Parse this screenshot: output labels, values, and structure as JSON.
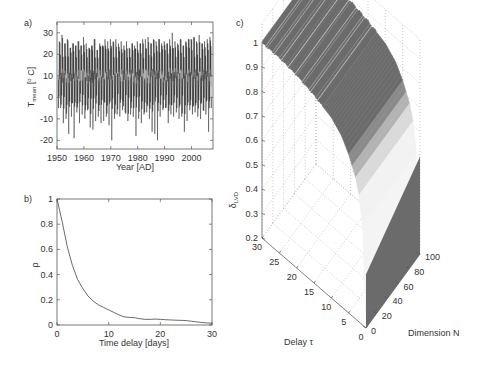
{
  "chart_data": [
    {
      "panel_label": "a)",
      "type": "line",
      "title": "",
      "xlabel": "Year [AD]",
      "ylabel": "T_mean [° C]",
      "ylabel_main": "T",
      "ylabel_sub": "mean",
      "ylabel_unit": "[",
      "ylabel_unit_sup": "o",
      "ylabel_unit_end": " C]",
      "xlim": [
        1950,
        2008
      ],
      "ylim": [
        -24,
        35
      ],
      "xticks": [
        1950,
        1960,
        1970,
        1980,
        1990,
        2000
      ],
      "yticks": [
        -20,
        -10,
        0,
        10,
        20,
        30
      ],
      "grid": false,
      "description": "Daily mean temperature series with strong annual cycle; summer peaks ~20-28 °C, winter troughs ~-5 to -20 °C, mean ~10 °C",
      "series": [
        {
          "name": "annual maxima (approx)",
          "x": [
            1951,
            1952,
            1953,
            1954,
            1955,
            1956,
            1957,
            1958,
            1959,
            1960,
            1961,
            1962,
            1963,
            1964,
            1965,
            1966,
            1967,
            1968,
            1969,
            1970,
            1971,
            1972,
            1973,
            1974,
            1975,
            1976,
            1977,
            1978,
            1979,
            1980,
            1981,
            1982,
            1983,
            1984,
            1985,
            1986,
            1987,
            1988,
            1989,
            1990,
            1991,
            1992,
            1993,
            1994,
            1995,
            1996,
            1997,
            1998,
            1999,
            2000,
            2001,
            2002,
            2003,
            2004,
            2005,
            2006,
            2007
          ],
          "values": [
            26,
            29,
            25,
            27,
            23,
            25,
            24,
            26,
            24,
            28,
            25,
            23,
            24,
            27,
            22,
            25,
            24,
            27,
            26,
            27,
            26,
            27,
            25,
            26,
            24,
            26,
            23,
            25,
            24,
            26,
            25,
            27,
            27,
            28,
            25,
            27,
            26,
            27,
            25,
            26,
            25,
            27,
            30,
            26,
            25,
            27,
            24,
            26,
            27,
            27,
            28,
            26,
            29,
            25,
            26,
            27,
            28
          ]
        },
        {
          "name": "annual minima (approx)",
          "x": [
            1951,
            1952,
            1953,
            1954,
            1955,
            1956,
            1957,
            1958,
            1959,
            1960,
            1961,
            1962,
            1963,
            1964,
            1965,
            1966,
            1967,
            1968,
            1969,
            1970,
            1971,
            1972,
            1973,
            1974,
            1975,
            1976,
            1977,
            1978,
            1979,
            1980,
            1981,
            1982,
            1983,
            1984,
            1985,
            1986,
            1987,
            1988,
            1989,
            1990,
            1991,
            1992,
            1993,
            1994,
            1995,
            1996,
            1997,
            1998,
            1999,
            2000,
            2001,
            2002,
            2003,
            2004,
            2005,
            2006,
            2007
          ],
          "values": [
            -5,
            -12,
            -10,
            -17,
            -9,
            -19,
            -7,
            -12,
            -8,
            -10,
            -6,
            -14,
            -15,
            -11,
            -9,
            -12,
            -11,
            -9,
            -13,
            -20,
            -10,
            -8,
            -9,
            -6,
            -7,
            -11,
            -8,
            -9,
            -18,
            -10,
            -12,
            -8,
            -7,
            -10,
            -16,
            -17,
            -20,
            -9,
            -6,
            -5,
            -12,
            -8,
            -9,
            -7,
            -10,
            -9,
            -16,
            -11,
            -6,
            -8,
            -7,
            -9,
            -10,
            -6,
            -8,
            -16,
            -5
          ]
        }
      ]
    },
    {
      "panel_label": "b)",
      "type": "line",
      "title": "",
      "xlabel": "Time delay [days]",
      "ylabel": "ρ",
      "xlim": [
        0,
        30
      ],
      "ylim": [
        0,
        1
      ],
      "xticks": [
        0,
        10,
        20,
        30
      ],
      "yticks": [
        0,
        0.2,
        0.4,
        0.6,
        0.8,
        1
      ],
      "ytick_labels": [
        "0",
        "0.2",
        "0.4",
        "0.6",
        "0.8",
        "1"
      ],
      "grid": false,
      "series": [
        {
          "name": "autocorrelation",
          "x": [
            0,
            1,
            2,
            3,
            4,
            5,
            6,
            7,
            8,
            9,
            10,
            11,
            12,
            13,
            14,
            15,
            16,
            17,
            18,
            19,
            20,
            21,
            22,
            23,
            24,
            25,
            26,
            27,
            28,
            29,
            30
          ],
          "values": [
            1.0,
            0.82,
            0.62,
            0.47,
            0.36,
            0.29,
            0.23,
            0.19,
            0.16,
            0.14,
            0.12,
            0.1,
            0.08,
            0.065,
            0.06,
            0.058,
            0.05,
            0.045,
            0.045,
            0.047,
            0.045,
            0.042,
            0.04,
            0.038,
            0.037,
            0.035,
            0.03,
            0.025,
            0.02,
            0.017,
            0.013
          ]
        }
      ]
    },
    {
      "panel_label": "c)",
      "type": "surface",
      "title": "",
      "xlabel": "Delay τ",
      "ylabel": "Dimension N",
      "zlabel": "δ_LVD",
      "zlabel_main": "δ",
      "zlabel_sub": "LVD",
      "xlim": [
        0,
        30
      ],
      "ylim": [
        0,
        100
      ],
      "zlim": [
        0.2,
        1
      ],
      "xticks": [
        0,
        5,
        10,
        15,
        20,
        25,
        30
      ],
      "yticks": [
        0,
        20,
        40,
        60,
        80,
        100
      ],
      "zticks": [
        0.2,
        0.3,
        0.4,
        0.5,
        0.6,
        0.7,
        0.8,
        0.9,
        1
      ],
      "ztick_labels": [
        "0.2",
        "0.3",
        "0.4",
        "0.5",
        "0.6",
        "0.7",
        "0.8",
        "0.9",
        "1"
      ],
      "grid": true,
      "description": "δ_LVD surface over delay τ (0-30) and dimension N (0-100); ≈1 for large delays, declining towards small delay; drops to ~0.2 near τ=0 for all N",
      "series": [
        {
          "name": "δ_LVD vs delay (any N, approx)",
          "x": [
            0,
            1,
            2,
            3,
            5,
            7,
            10,
            15,
            20,
            25,
            30
          ],
          "values": [
            0.2,
            0.6,
            0.72,
            0.78,
            0.85,
            0.9,
            0.94,
            0.97,
            0.99,
            1.0,
            1.0
          ]
        }
      ]
    }
  ]
}
